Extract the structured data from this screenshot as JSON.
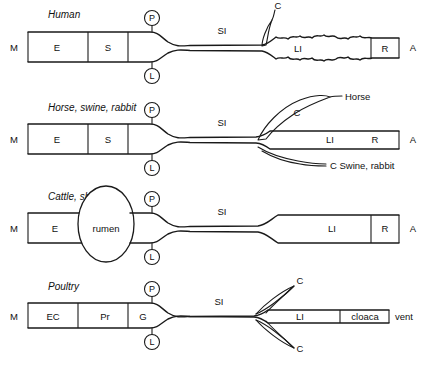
{
  "diagram": {
    "type": "anatomical-schematic",
    "stroke_color": "#1a1a1a",
    "background_color": "#ffffff"
  },
  "panels": [
    {
      "id": "human",
      "title": "Human",
      "mouth_label": "M",
      "anus_label": "A",
      "segments": [
        {
          "key": "esophagus",
          "label": "E"
        },
        {
          "key": "stomach",
          "label": "S"
        }
      ],
      "small_intestine_label": "SI",
      "large_intestine_label": "LI",
      "rectum_label": "R",
      "cecum_label": "C",
      "nodes": [
        {
          "key": "pancreas",
          "label": "P"
        },
        {
          "key": "liver",
          "label": "L"
        }
      ],
      "notes": []
    },
    {
      "id": "horse-swine-rabbit",
      "title": "Horse, swine, rabbit",
      "mouth_label": "M",
      "anus_label": "A",
      "segments": [
        {
          "key": "esophagus",
          "label": "E"
        },
        {
          "key": "stomach",
          "label": "S"
        }
      ],
      "small_intestine_label": "SI",
      "large_intestine_label": "LI",
      "rectum_label": "R",
      "cecum_label": "C",
      "nodes": [
        {
          "key": "pancreas",
          "label": "P"
        },
        {
          "key": "liver",
          "label": "L"
        }
      ],
      "notes": [
        {
          "key": "horse-cecum",
          "label": "Horse"
        },
        {
          "key": "swine-rabbit-cecum",
          "label": "C Swine, rabbit"
        }
      ]
    },
    {
      "id": "cattle-sheep",
      "title": "Cattle, sheep",
      "mouth_label": "M",
      "anus_label": "A",
      "segments": [
        {
          "key": "esophagus",
          "label": "E"
        }
      ],
      "rumen_label": "rumen",
      "small_intestine_label": "SI",
      "large_intestine_label": "LI",
      "rectum_label": "R",
      "nodes": [
        {
          "key": "pancreas",
          "label": "P"
        },
        {
          "key": "liver",
          "label": "L"
        }
      ],
      "notes": []
    },
    {
      "id": "poultry",
      "title": "Poultry",
      "mouth_label": "M",
      "vent_label": "vent",
      "segments": [
        {
          "key": "esophagus-crop",
          "label": "EC"
        },
        {
          "key": "proventriculus",
          "label": "Pr"
        },
        {
          "key": "gizzard",
          "label": "G"
        }
      ],
      "small_intestine_label": "SI",
      "large_intestine_label": "LI",
      "cloaca_label": "cloaca",
      "cecum_upper_label": "C",
      "cecum_lower_label": "C",
      "nodes": [
        {
          "key": "pancreas",
          "label": "P"
        },
        {
          "key": "liver",
          "label": "L"
        }
      ],
      "notes": []
    }
  ]
}
